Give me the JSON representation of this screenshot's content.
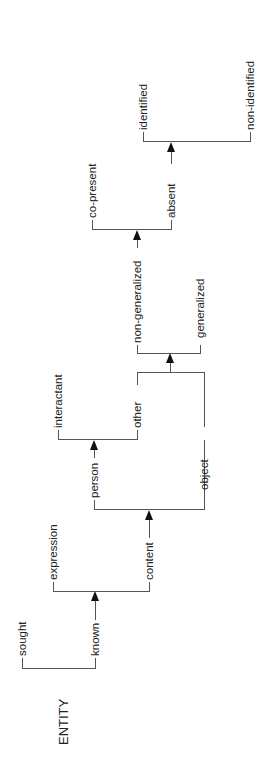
{
  "title": "ENTITY",
  "nodes": {
    "sought": "sought",
    "known": "known",
    "expression": "expression",
    "content": "content",
    "person": "person",
    "object": "object",
    "interactant": "interactant",
    "other": "other",
    "non_generalized": "non-generalized",
    "generalized": "generalized",
    "co_present": "co-present",
    "absent": "absent",
    "identified": "identified",
    "non_identified": "non-identified"
  },
  "orientation": "rotated -90 degrees",
  "colors": {
    "line": "#555555",
    "arrow": "#111111",
    "text": "#222222"
  }
}
